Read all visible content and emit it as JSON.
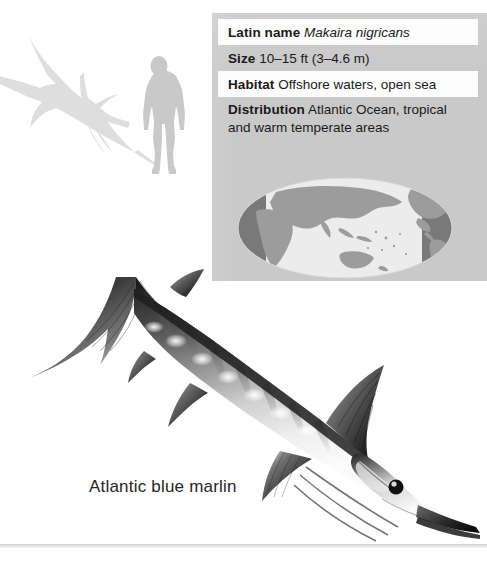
{
  "page": {
    "background_color": "#ffffff",
    "caption": "Atlantic blue marlin"
  },
  "scale_diagram": {
    "name": "size-comparison-silhouettes",
    "fish_silhouette_label": "blue marlin silhouette",
    "human_silhouette_label": "human figure for scale",
    "silhouette_color": "#dededc"
  },
  "info_panel": {
    "background_color": "#c9c9c9",
    "row_background_color": "#fdfdfd",
    "rows": [
      {
        "label": "Latin name",
        "value": "Makaira nigricans",
        "italic": true,
        "shade": "white"
      },
      {
        "label": "Size",
        "value": "10–15 ft (3–4.6 m)",
        "italic": false,
        "shade": "gray"
      },
      {
        "label": "Habitat",
        "value": "Offshore waters, open sea",
        "italic": false,
        "shade": "white"
      },
      {
        "label": "Distribution",
        "value": "Atlantic Ocean, tropical and warm temperate areas",
        "italic": false,
        "shade": "gray"
      }
    ]
  },
  "globe": {
    "name": "world-distribution-map",
    "ocean_color": "#ececec",
    "land_color": "#9a9a9a",
    "highlight_color": "#6f6f6f",
    "highlight_description": "Atlantic Ocean range highlighted"
  },
  "illustration": {
    "name": "atlantic-blue-marlin-illustration",
    "subject": "Atlantic blue marlin",
    "style": "grayscale airbrush illustration"
  },
  "footer": {
    "rule_color": "#cfcfcf"
  }
}
